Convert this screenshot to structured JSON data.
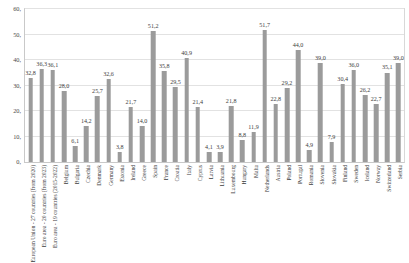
{
  "chart_data": {
    "type": "bar",
    "title": "",
    "subtitle": "",
    "xlabel": "",
    "ylabel": "",
    "ylim": [
      0,
      60
    ],
    "yticks": [
      "0,",
      "10,",
      "20,",
      "30,",
      "40,",
      "50,",
      "60,"
    ],
    "ytick_values": [
      0,
      10,
      20,
      30,
      40,
      50,
      60
    ],
    "grid": true,
    "legend": "none",
    "bar_color": "#9b9b9b",
    "gridline_color": "#e2e2e2",
    "axis_color": "#c9c9c9",
    "decimal_separator": ",",
    "categories": [
      "European Union - 27 countries (from 2020)",
      "Euro area - 20 countries (from 2023)",
      "Euro area - 19 countries (2015-2022)",
      "Belgium",
      "Bulgaria",
      "Czechia",
      "Denmark",
      "Germany",
      "Estonia",
      "Ireland",
      "Greece",
      "Spain",
      "France",
      "Croatia",
      "Italy",
      "Cyprus",
      "Latvia",
      "Lithuania",
      "Luxembourg",
      "Hungary",
      "Malta",
      "Netherlands",
      "Austria",
      "Poland",
      "Portugal",
      "Romania",
      "Slovenia",
      "Slovakia",
      "Finland",
      "Sweden",
      "Iceland",
      "Norway",
      "Switzerland",
      "Serbia"
    ],
    "values": [
      32.8,
      36.3,
      36.1,
      28.0,
      6.1,
      14.2,
      25.7,
      32.6,
      3.8,
      21.7,
      14.0,
      51.2,
      35.8,
      29.5,
      40.9,
      21.4,
      4.1,
      3.9,
      21.8,
      8.8,
      11.9,
      51.7,
      22.8,
      29.2,
      44.0,
      4.9,
      39.0,
      7.9,
      30.4,
      36.0,
      26.2,
      22.7,
      35.1,
      39.0
    ],
    "value_labels": [
      "32,8",
      "36,3",
      "36,1",
      "28,0",
      "6,1",
      "14,2",
      "25,7",
      "32,6",
      "3,8",
      "21,7",
      "14,0",
      "51,2",
      "35,8",
      "29,5",
      "40,9",
      "21,4",
      "4,1",
      "3,9",
      "21,8",
      "8,8",
      "11,9",
      "51,7",
      "22,8",
      "29,2",
      "44,0",
      "4,9",
      "39,0",
      "7,9",
      "30,4",
      "36,0",
      "26,2",
      "22,7",
      "35,1",
      "39,0"
    ]
  }
}
